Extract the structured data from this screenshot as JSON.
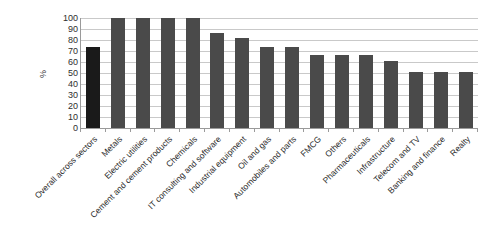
{
  "chart_data": {
    "type": "bar",
    "title": "",
    "xlabel": "",
    "ylabel": "%",
    "ylim": [
      0,
      100
    ],
    "ytick_step": 10,
    "grid": true,
    "legend": "none",
    "categories": [
      "Overall across sectors",
      "Metals",
      "Electric utilities",
      "Cement and cement products",
      "Chemicals",
      "IT consulting and software",
      "Industrial equipment",
      "Oil and gas",
      "Automobiles and parts",
      "FMCG",
      "Others",
      "Pharmaceuticals",
      "Infrastructure",
      "Telecom and TV",
      "Banking and finance",
      "Realty"
    ],
    "values": [
      74,
      100,
      100,
      100,
      100,
      86,
      82,
      74,
      74,
      66,
      66,
      66,
      61,
      51,
      51,
      51
    ],
    "ytick_labels": [
      "100",
      "90",
      "80",
      "70",
      "60",
      "50",
      "40",
      "30",
      "20",
      "10",
      "0"
    ],
    "bar_color": "#4a4a4a",
    "highlight_bar_color": "#1a1a1a",
    "highlight_index": 0,
    "grid_color": "#c9c9c9",
    "axis_color": "#9a9a9a",
    "background": "#ffffff"
  }
}
